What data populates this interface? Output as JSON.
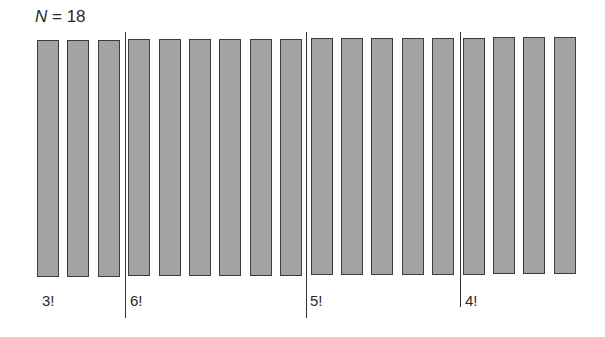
{
  "title": {
    "var": "N",
    "rest": " = 18"
  },
  "diagram": {
    "bar_count": 18,
    "bar_color": "#a3a3a3",
    "groups": [
      {
        "label": "3!",
        "bars": 3
      },
      {
        "label": "6!",
        "bars": 6
      },
      {
        "label": "5!",
        "bars": 5
      },
      {
        "label": "4!",
        "bars": 4
      }
    ]
  }
}
